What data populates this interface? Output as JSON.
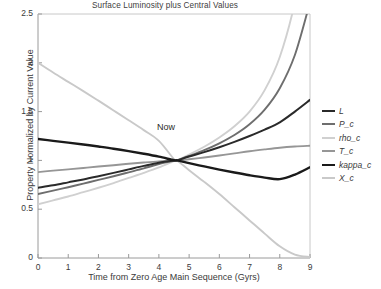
{
  "chart": {
    "title": "Surface Luminosity plus Central Values",
    "xlabel": "Time from Zero Age Main Sequence (Gyrs)",
    "ylabel": "Property Normalized by Current Value",
    "annotation": "Now"
  },
  "axes": {
    "xticks": [
      "0",
      "1",
      "2",
      "3",
      "4",
      "5",
      "6",
      "7",
      "8",
      "9"
    ],
    "yticks": [
      "0",
      "0.5",
      "1",
      "1.5",
      "2",
      "2.5"
    ]
  },
  "legend": [
    {
      "label": "L",
      "color": "#2a2a2a",
      "width": 2.0
    },
    {
      "label": "P_c",
      "color": "#6e6e6e",
      "width": 1.9
    },
    {
      "label": "rho_c",
      "color": "#d0d0d0",
      "width": 1.9
    },
    {
      "label": "T_c",
      "color": "#969696",
      "width": 1.9
    },
    {
      "label": "kappa_c",
      "color": "#1a1a1a",
      "width": 2.4
    },
    {
      "label": "X_c",
      "color": "#c9c9c9",
      "width": 1.9
    }
  ],
  "chart_data": {
    "type": "line",
    "title": "Surface Luminosity plus Central Values",
    "xlabel": "Time from Zero Age Main Sequence (Gyrs)",
    "ylabel": "Property Normalized by Current Value",
    "xlim": [
      0,
      9
    ],
    "ylim": [
      0,
      2.5
    ],
    "grid": false,
    "legend_position": "right",
    "annotations": [
      {
        "text": "Now",
        "x": 4.6,
        "y": 1.12
      }
    ],
    "x": [
      0,
      0.5,
      1,
      1.5,
      2,
      2.5,
      3,
      3.5,
      4,
      4.5,
      4.6,
      5,
      5.5,
      6,
      6.5,
      7,
      7.5,
      8,
      8.5,
      9
    ],
    "series": [
      {
        "name": "L",
        "color": "#2a2a2a",
        "values": [
          0.72,
          0.745,
          0.775,
          0.805,
          0.838,
          0.872,
          0.908,
          0.944,
          0.977,
          0.998,
          1.0,
          1.04,
          1.085,
          1.135,
          1.19,
          1.25,
          1.315,
          1.39,
          1.5,
          1.62
        ]
      },
      {
        "name": "P_c",
        "color": "#6e6e6e",
        "values": [
          0.655,
          0.69,
          0.725,
          0.762,
          0.8,
          0.838,
          0.878,
          0.918,
          0.962,
          0.996,
          1.0,
          1.045,
          1.105,
          1.175,
          1.26,
          1.37,
          1.52,
          1.74,
          2.08,
          2.62
        ]
      },
      {
        "name": "rho_c",
        "color": "#d0d0d0",
        "values": [
          0.55,
          0.59,
          0.63,
          0.675,
          0.72,
          0.768,
          0.82,
          0.872,
          0.928,
          0.993,
          1.0,
          1.06,
          1.14,
          1.235,
          1.35,
          1.5,
          1.72,
          2.06,
          2.62,
          3.45
        ]
      },
      {
        "name": "T_c",
        "color": "#969696",
        "values": [
          0.88,
          0.895,
          0.908,
          0.922,
          0.937,
          0.951,
          0.965,
          0.978,
          0.99,
          0.999,
          1.0,
          1.012,
          1.03,
          1.05,
          1.072,
          1.094,
          1.113,
          1.13,
          1.142,
          1.15
        ]
      },
      {
        "name": "kappa_c",
        "color": "#1a1a1a",
        "values": [
          1.22,
          1.2,
          1.182,
          1.163,
          1.142,
          1.12,
          1.095,
          1.068,
          1.038,
          1.002,
          1.0,
          0.972,
          0.938,
          0.906,
          0.876,
          0.848,
          0.824,
          0.808,
          0.855,
          0.93
        ]
      },
      {
        "name": "X_c",
        "color": "#c9c9c9",
        "values": [
          2.0,
          1.9,
          1.805,
          1.71,
          1.612,
          1.512,
          1.412,
          1.31,
          1.2,
          1.012,
          1.0,
          0.9,
          0.78,
          0.655,
          0.52,
          0.385,
          0.25,
          0.12,
          0.035,
          0.01
        ]
      }
    ]
  }
}
